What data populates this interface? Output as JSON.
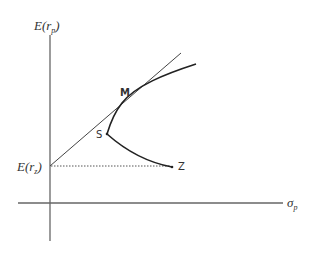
{
  "diagram": {
    "y_axis": {
      "label_main": "E(r",
      "label_sub": "p",
      "label_close": ")"
    },
    "x_axis": {
      "label_main": "σ",
      "label_sub": "p"
    },
    "intercept": {
      "label_main": "E(r",
      "label_sub": "z",
      "label_close": ")"
    },
    "points": {
      "M": "M",
      "S": "S",
      "Z": "Z"
    },
    "colors": {
      "axis": "#666666",
      "curve": "#222222",
      "line": "#444444",
      "dotted": "#555555"
    }
  }
}
